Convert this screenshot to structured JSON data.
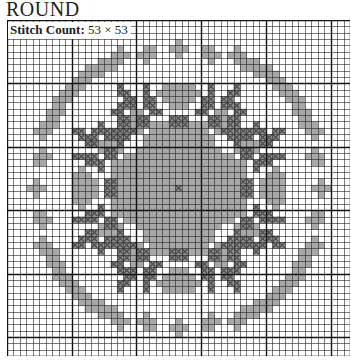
{
  "title": "ROUND",
  "stitch_count": {
    "label": "Stitch Count:",
    "value": "53 × 53"
  },
  "grid": {
    "cols": 53,
    "rows": 53,
    "major_every": 10,
    "colors": {
      "light": "#a8a8a8",
      "dark": "#4a4a4a",
      "line": "#222222",
      "major_line": "#111111",
      "bg": "#ffffff"
    }
  },
  "pattern": {
    "symmetry": "4-fold mirror about center (26,26)",
    "ring_light": [
      [
        4,
        21
      ],
      [
        4,
        22
      ],
      [
        5,
        20
      ],
      [
        5,
        21
      ],
      [
        5,
        22
      ],
      [
        6,
        21
      ],
      [
        3,
        26
      ],
      [
        4,
        25
      ],
      [
        4,
        26
      ],
      [
        4,
        27
      ],
      [
        5,
        26
      ],
      [
        4,
        30
      ],
      [
        4,
        31
      ],
      [
        5,
        30
      ],
      [
        5,
        31
      ],
      [
        5,
        32
      ],
      [
        6,
        31
      ],
      [
        5,
        16
      ],
      [
        5,
        17
      ],
      [
        6,
        16
      ],
      [
        6,
        17
      ],
      [
        6,
        15
      ],
      [
        7,
        16
      ],
      [
        7,
        12
      ],
      [
        7,
        13
      ],
      [
        8,
        11
      ],
      [
        8,
        12
      ],
      [
        8,
        13
      ],
      [
        9,
        12
      ],
      [
        10,
        9
      ],
      [
        10,
        10
      ],
      [
        11,
        9
      ],
      [
        11,
        10
      ],
      [
        11,
        8
      ],
      [
        12,
        9
      ],
      [
        13,
        7
      ],
      [
        13,
        8
      ],
      [
        14,
        6
      ],
      [
        14,
        7
      ],
      [
        14,
        8
      ],
      [
        15,
        7
      ],
      [
        16,
        5
      ],
      [
        16,
        6
      ],
      [
        17,
        5
      ],
      [
        17,
        6
      ],
      [
        17,
        4
      ],
      [
        18,
        5
      ]
    ],
    "center_light": [
      [
        10,
        24
      ],
      [
        10,
        25
      ],
      [
        10,
        26
      ],
      [
        11,
        23
      ],
      [
        11,
        24
      ],
      [
        11,
        25
      ],
      [
        11,
        26
      ],
      [
        12,
        24
      ],
      [
        12,
        25
      ],
      [
        12,
        26
      ],
      [
        14,
        19
      ],
      [
        14,
        20
      ],
      [
        15,
        18
      ],
      [
        15,
        19
      ],
      [
        15,
        20
      ],
      [
        15,
        21
      ],
      [
        16,
        19
      ],
      [
        16,
        20
      ],
      [
        16,
        21
      ],
      [
        17,
        20
      ],
      [
        16,
        24
      ],
      [
        16,
        25
      ],
      [
        16,
        26
      ],
      [
        17,
        23
      ],
      [
        17,
        24
      ],
      [
        17,
        25
      ],
      [
        17,
        26
      ],
      [
        18,
        22
      ],
      [
        18,
        23
      ],
      [
        18,
        24
      ],
      [
        18,
        25
      ],
      [
        18,
        26
      ],
      [
        19,
        21
      ],
      [
        19,
        22
      ],
      [
        19,
        23
      ],
      [
        19,
        24
      ],
      [
        19,
        25
      ],
      [
        19,
        26
      ],
      [
        20,
        20
      ],
      [
        20,
        21
      ],
      [
        20,
        22
      ],
      [
        20,
        23
      ],
      [
        20,
        24
      ],
      [
        20,
        25
      ],
      [
        20,
        26
      ],
      [
        21,
        18
      ],
      [
        21,
        19
      ],
      [
        21,
        20
      ],
      [
        21,
        21
      ],
      [
        21,
        22
      ],
      [
        21,
        23
      ],
      [
        21,
        24
      ],
      [
        21,
        25
      ],
      [
        21,
        26
      ],
      [
        22,
        16
      ],
      [
        22,
        17
      ],
      [
        22,
        18
      ],
      [
        22,
        19
      ],
      [
        22,
        22
      ],
      [
        22,
        23
      ],
      [
        22,
        24
      ],
      [
        22,
        25
      ],
      [
        22,
        26
      ],
      [
        23,
        16
      ],
      [
        23,
        17
      ],
      [
        23,
        18
      ],
      [
        23,
        23
      ],
      [
        23,
        24
      ],
      [
        23,
        25
      ],
      [
        23,
        26
      ],
      [
        24,
        17
      ],
      [
        24,
        18
      ],
      [
        24,
        24
      ],
      [
        24,
        25
      ],
      [
        24,
        26
      ],
      [
        25,
        19
      ],
      [
        25,
        20
      ],
      [
        25,
        21
      ],
      [
        25,
        22
      ],
      [
        25,
        23
      ],
      [
        25,
        24
      ],
      [
        25,
        25
      ],
      [
        25,
        26
      ],
      [
        26,
        19
      ],
      [
        26,
        20
      ],
      [
        26,
        21
      ],
      [
        26,
        22
      ],
      [
        26,
        23
      ],
      [
        26,
        24
      ],
      [
        26,
        25
      ],
      [
        26,
        26
      ],
      [
        24,
        11
      ],
      [
        24,
        12
      ],
      [
        25,
        10
      ],
      [
        25,
        11
      ],
      [
        25,
        12
      ],
      [
        25,
        13
      ],
      [
        26,
        10
      ],
      [
        26,
        11
      ],
      [
        26,
        12
      ],
      [
        26,
        13
      ]
    ],
    "center_dark": [
      [
        10,
        17
      ],
      [
        11,
        17
      ],
      [
        11,
        18
      ],
      [
        12,
        18
      ],
      [
        12,
        19
      ],
      [
        13,
        19
      ],
      [
        13,
        18
      ],
      [
        10,
        21
      ],
      [
        11,
        21
      ],
      [
        12,
        21
      ],
      [
        13,
        21
      ],
      [
        12,
        22
      ],
      [
        14,
        22
      ],
      [
        14,
        23
      ],
      [
        16,
        14
      ],
      [
        17,
        14
      ],
      [
        17,
        15
      ],
      [
        17,
        16
      ],
      [
        17,
        17
      ],
      [
        17,
        13
      ],
      [
        18,
        15
      ],
      [
        18,
        16
      ],
      [
        18,
        17
      ],
      [
        18,
        18
      ],
      [
        19,
        17
      ],
      [
        18,
        12
      ],
      [
        19,
        13
      ],
      [
        20,
        15
      ],
      [
        20,
        16
      ],
      [
        21,
        15
      ],
      [
        21,
        16
      ],
      [
        22,
        12
      ],
      [
        22,
        13
      ],
      [
        21,
        12
      ],
      [
        25,
        15
      ],
      [
        25,
        16
      ],
      [
        26,
        15
      ],
      [
        26,
        16
      ],
      [
        26,
        26
      ]
    ]
  }
}
